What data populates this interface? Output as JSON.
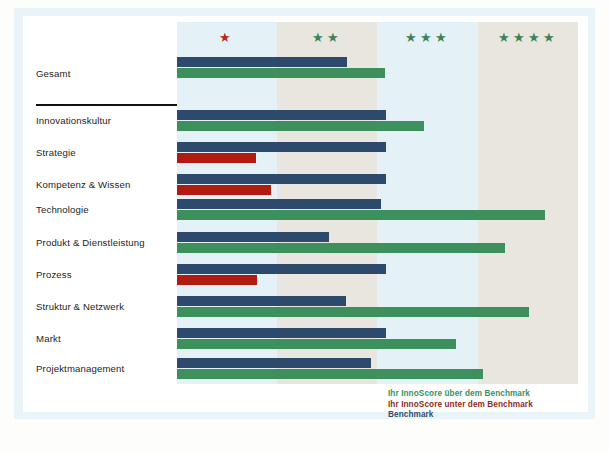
{
  "chart_data": {
    "type": "bar",
    "title": "",
    "subtitle": "",
    "orientation": "horizontal",
    "xlabel": "",
    "ylabel": "",
    "xlim": [
      0,
      4
    ],
    "grid": false,
    "legend_position": "bottom-right",
    "axis_bands": [
      {
        "label": "★",
        "stars": 1,
        "star_color": "#c0241a",
        "range": [
          0,
          1
        ],
        "fill": "#e4f1f7"
      },
      {
        "label": "★★",
        "stars": 2,
        "star_color": "#3d8257",
        "range": [
          1,
          2
        ],
        "fill": "#e8e6df"
      },
      {
        "label": "★★★",
        "stars": 3,
        "star_color": "#3d8257",
        "range": [
          2,
          3
        ],
        "fill": "#e4f1f7"
      },
      {
        "label": "★★★★",
        "stars": 4,
        "star_color": "#3d8257",
        "range": [
          3,
          4
        ],
        "fill": "#e8e6df"
      }
    ],
    "categories": [
      "Gesamt",
      "Innovationskultur",
      "Strategie",
      "Kompetenz & Wissen",
      "Technologie",
      "Produkt & Dienstleistung",
      "Prozess",
      "Struktur & Netzwerk",
      "Markt",
      "Projektmanagement"
    ],
    "series": [
      {
        "name": "Benchmark",
        "color": "#2d4a6d",
        "values": [
          1.7,
          2.09,
          2.09,
          2.09,
          2.04,
          1.52,
          2.09,
          1.69,
          2.09,
          1.94
        ]
      },
      {
        "name": "Ihr InnoScore",
        "values": [
          2.08,
          2.47,
          0.79,
          0.94,
          3.67,
          3.27,
          0.8,
          3.51,
          2.78,
          3.05
        ],
        "above_color": "#3d8f5c",
        "below_color": "#b01c12",
        "above_benchmark": [
          true,
          true,
          false,
          false,
          true,
          true,
          false,
          true,
          true,
          true
        ]
      }
    ],
    "legend": [
      {
        "text": "Ihr InnoScore über dem Benchmark",
        "color": "#3d8f5c"
      },
      {
        "text": "Ihr InnoScore unter dem Benchmark",
        "color": "#8e2a22"
      },
      {
        "text": "Benchmark",
        "color": "#2d4a6d"
      }
    ],
    "separator_after_category": "Gesamt"
  }
}
